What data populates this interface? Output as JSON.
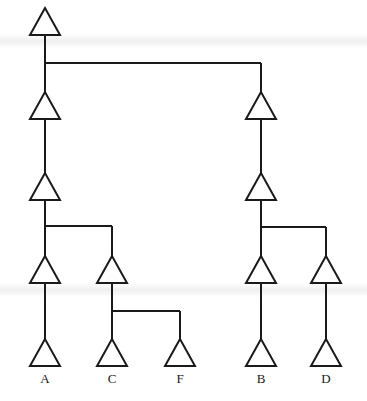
{
  "diagram": {
    "type": "tree",
    "stroke_color": "#1a1a1a",
    "background": "#ffffff",
    "nodes": [
      {
        "id": "n0",
        "x": 45,
        "y": 8,
        "label": ""
      },
      {
        "id": "n1",
        "x": 45,
        "y": 92,
        "label": ""
      },
      {
        "id": "n2",
        "x": 45,
        "y": 173,
        "label": ""
      },
      {
        "id": "n3",
        "x": 45,
        "y": 256,
        "label": ""
      },
      {
        "id": "n4",
        "x": 112,
        "y": 256,
        "label": ""
      },
      {
        "id": "leafA",
        "x": 45,
        "y": 339,
        "label": "A"
      },
      {
        "id": "leafC",
        "x": 112,
        "y": 339,
        "label": "C"
      },
      {
        "id": "leafF",
        "x": 180,
        "y": 339,
        "label": "F"
      },
      {
        "id": "n5",
        "x": 261,
        "y": 92,
        "label": ""
      },
      {
        "id": "n6",
        "x": 261,
        "y": 173,
        "label": ""
      },
      {
        "id": "n7",
        "x": 261,
        "y": 256,
        "label": ""
      },
      {
        "id": "n8",
        "x": 326,
        "y": 256,
        "label": ""
      },
      {
        "id": "leafB",
        "x": 261,
        "y": 339,
        "label": "B"
      },
      {
        "id": "leafD",
        "x": 326,
        "y": 339,
        "label": "D"
      }
    ],
    "lines": [
      [
        45,
        34,
        45,
        92
      ],
      [
        45,
        63,
        261,
        63
      ],
      [
        261,
        63,
        261,
        92
      ],
      [
        45,
        118,
        45,
        173
      ],
      [
        45,
        201,
        45,
        256
      ],
      [
        45,
        226,
        112,
        226
      ],
      [
        112,
        226,
        112,
        256
      ],
      [
        45,
        283,
        45,
        339
      ],
      [
        112,
        283,
        112,
        339
      ],
      [
        112,
        311,
        180,
        311
      ],
      [
        180,
        311,
        180,
        339
      ],
      [
        261,
        118,
        261,
        173
      ],
      [
        261,
        201,
        261,
        256
      ],
      [
        261,
        227,
        326,
        227
      ],
      [
        326,
        227,
        326,
        256
      ],
      [
        261,
        283,
        261,
        339
      ],
      [
        326,
        283,
        326,
        339
      ]
    ],
    "triangle": {
      "half_width": 15,
      "height": 27
    },
    "leaf_labels": [
      {
        "text": "A",
        "x": 45
      },
      {
        "text": "C",
        "x": 112
      },
      {
        "text": "F",
        "x": 180
      },
      {
        "text": "B",
        "x": 261
      },
      {
        "text": "D",
        "x": 326
      }
    ],
    "label_y": 372
  }
}
